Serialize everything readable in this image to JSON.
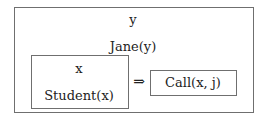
{
  "diagram": {
    "type": "DRS (discourse representation structure)",
    "outer_box": {
      "referent": "y",
      "conditions": [
        "Jane(y)"
      ]
    },
    "conditional": {
      "antecedent_box": {
        "referent": "x",
        "conditions": [
          "Student(x)"
        ]
      },
      "arrow": "⇒",
      "consequent_box": {
        "conditions": [
          "Call(x, j)"
        ]
      }
    }
  },
  "colors": {
    "border": "#6f6f6f",
    "text": "#222222",
    "background": "#ffffff"
  }
}
